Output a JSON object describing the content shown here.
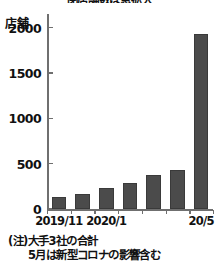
{
  "chart_data": {
    "type": "bar",
    "title": "閉店舗数は急拡大",
    "subtitle": "",
    "xlabel": "",
    "ylabel": "店舗",
    "unit_label": "店舗",
    "categories": [
      "2019/11",
      "2019/12",
      "2020/1",
      "2020/2",
      "2020/3",
      "2020/4",
      "20/5"
    ],
    "values": [
      135,
      170,
      235,
      285,
      370,
      430,
      1925
    ],
    "visible_x_tick_labels": [
      {
        "category": "2019/11",
        "text": "2019/11"
      },
      {
        "category": "2020/1",
        "text": "2020/1"
      },
      {
        "category": "20/5",
        "text": "20/5"
      }
    ],
    "y_ticks": [
      0,
      500,
      1000,
      1500,
      2000
    ],
    "y_tick_labels": [
      "0",
      "500",
      "1000",
      "1500",
      "2000"
    ],
    "ylim": [
      0,
      2150
    ],
    "grid": false,
    "legend": false,
    "legend_position": "none",
    "bar_color": "#4b4b4b",
    "axis_color": "#6f6f6f",
    "text_color": "#111111",
    "background_color": "#ffffff",
    "annotations": [
      "(注)大手3社の合計",
      "5月は新型コロナの影響含む"
    ]
  },
  "footnote": {
    "line1": "(注)大手3社の合計",
    "line2": "5月は新型コロナの影響含む"
  }
}
